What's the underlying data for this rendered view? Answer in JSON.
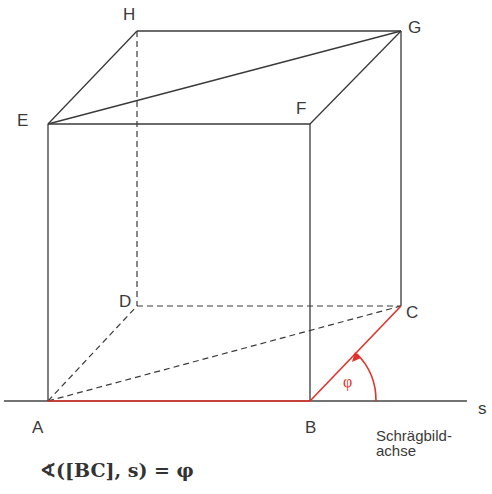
{
  "diagram": {
    "vertices": {
      "A": {
        "label": "A",
        "x": 47,
        "y": 401
      },
      "B": {
        "label": "B",
        "x": 310,
        "y": 401
      },
      "C": {
        "label": "C",
        "x": 401,
        "y": 306
      },
      "D": {
        "label": "D",
        "x": 137,
        "y": 306
      },
      "E": {
        "label": "E",
        "x": 48,
        "y": 124
      },
      "F": {
        "label": "F",
        "x": 310,
        "y": 124
      },
      "G": {
        "label": "G",
        "x": 402,
        "y": 31
      },
      "H": {
        "label": "H",
        "x": 137,
        "y": 31
      }
    },
    "axis": {
      "label": "s",
      "caption_line1": "Schrägbild-",
      "caption_line2": "achse"
    },
    "angle": {
      "label": "φ"
    },
    "formula": "∢([BC], s) = φ",
    "colors": {
      "line": "#3a3a3a",
      "highlight": "#e0322a"
    }
  }
}
